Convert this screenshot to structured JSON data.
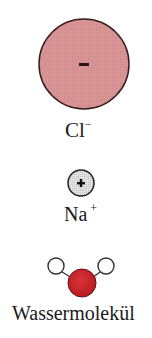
{
  "legend": {
    "chloride": {
      "label": "Cl",
      "charge_label": "−",
      "sign": "−",
      "fill_color": "#d99595",
      "stroke_color": "#3a1e1e"
    },
    "sodium": {
      "label": "Na",
      "charge_label": "+",
      "sign": "+",
      "fill_color": "#dcdcdc",
      "stroke_color": "#222222"
    },
    "water": {
      "label": "Wassermolekül",
      "oxygen_color": "#c8242a",
      "hydrogen_color": "#ffffff",
      "stroke_color": "#333333"
    }
  }
}
